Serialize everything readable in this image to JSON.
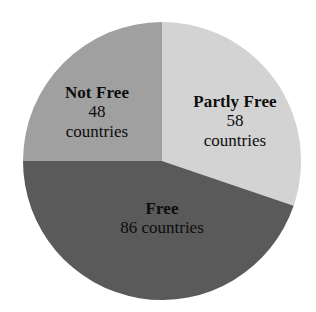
{
  "chart_data": {
    "type": "pie",
    "title": "",
    "subtitle": "",
    "xlabel": "",
    "ylabel": "",
    "legend_position": "none",
    "grid": false,
    "total": 192,
    "unit_label": "countries",
    "start_angle_deg": 0,
    "direction": "clockwise",
    "categories": [
      "Partly Free",
      "Free",
      "Not Free"
    ],
    "values": [
      58,
      86,
      48
    ],
    "slices": [
      {
        "name": "Partly Free",
        "value": 58,
        "unit": "countries",
        "percent": 30.2,
        "start_angle_deg": 0,
        "end_angle_deg": 108.75,
        "color": "#d3d3d3",
        "label_line1": "Partly Free",
        "label_line2": "58",
        "label_line3": "countries"
      },
      {
        "name": "Free",
        "value": 86,
        "unit": "countries",
        "percent": 44.8,
        "start_angle_deg": 108.75,
        "end_angle_deg": 270,
        "color": "#5a5a5a",
        "label_line1": "Free",
        "label_line2": "86 countries",
        "label_line3": ""
      },
      {
        "name": "Not Free",
        "value": 48,
        "unit": "countries",
        "percent": 25.0,
        "start_angle_deg": 270,
        "end_angle_deg": 360,
        "color": "#a0a0a0",
        "label_line1": "Not Free",
        "label_line2": "48",
        "label_line3": "countries"
      }
    ],
    "colors": {
      "partly_free": "#d3d3d3",
      "free": "#5a5a5a",
      "not_free": "#a0a0a0",
      "background": "#ffffff",
      "label_text": "#0d0d0d"
    }
  }
}
